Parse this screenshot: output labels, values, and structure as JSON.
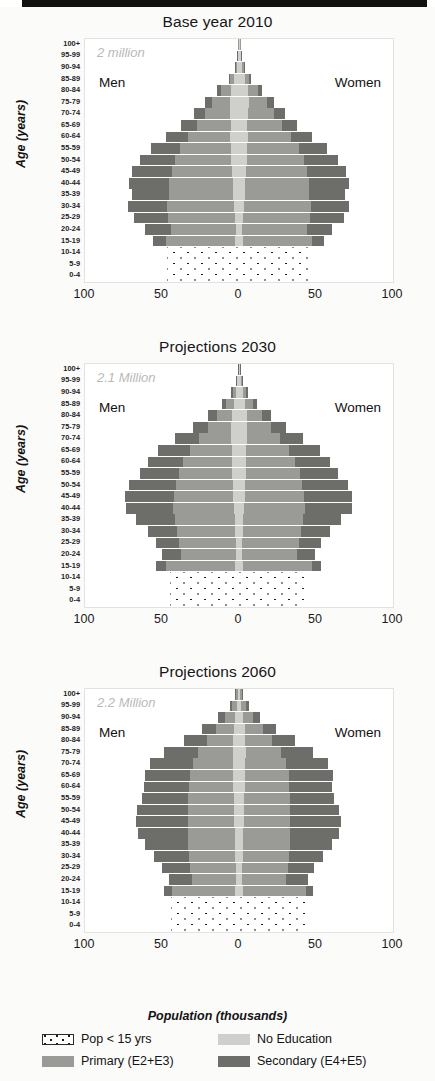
{
  "figure": {
    "xaxis_title": "Population (thousands)",
    "yaxis_title": "Age (years)",
    "men_label": "Men",
    "women_label": "Women",
    "xticks": [
      "100",
      "50",
      "0",
      "50",
      "100"
    ],
    "age_groups": [
      "100+",
      "95-99",
      "90-94",
      "85-89",
      "80-84",
      "75-79",
      "70-74",
      "65-69",
      "60-64",
      "55-59",
      "50-54",
      "45-49",
      "40-44",
      "35-39",
      "30-34",
      "25-29",
      "20-24",
      "15-19",
      "10-14",
      "5-9",
      "0-4"
    ],
    "colors": {
      "no_education": "#cfcfcb",
      "primary": "#9a9a96",
      "secondary": "#6d6d6a",
      "pop_under_15": "#ffffff",
      "dots": "#1b1b1b"
    }
  },
  "legend": {
    "items": [
      {
        "key": "pop_under_15",
        "label": "Pop < 15 yrs",
        "swatch": "kids"
      },
      {
        "key": "no_education",
        "label": "No Education",
        "swatch": "noedu"
      },
      {
        "key": "primary",
        "label": "Primary (E2+E3)",
        "swatch": "primary"
      },
      {
        "key": "secondary",
        "label": "Secondary (E4+E5)",
        "swatch": "secondary"
      }
    ]
  },
  "chart_data": [
    {
      "type": "bar",
      "title": "Base year 2010",
      "annotation": "2 million",
      "xlabel": "Population (thousands)",
      "ylabel": "Age (years)",
      "xlim": [
        -100,
        100
      ],
      "xticks": [
        -100,
        -50,
        0,
        50,
        100
      ],
      "grid": false,
      "legend_position": "below-figure",
      "categories": [
        "100+",
        "95-99",
        "90-94",
        "85-89",
        "80-84",
        "75-79",
        "70-74",
        "65-69",
        "60-64",
        "55-59",
        "50-54",
        "45-49",
        "40-44",
        "35-39",
        "30-34",
        "25-29",
        "20-24",
        "15-19",
        "10-14",
        "5-9",
        "0-4"
      ],
      "under15_groups": [
        "10-14",
        "5-9",
        "0-4"
      ],
      "under15_extent": {
        "men": 47,
        "women": 46
      },
      "series": [
        {
          "name": "No Education",
          "side": "men",
          "values": [
            0.6,
            0.9,
            1.6,
            3.0,
            5.0,
            5.8,
            5.6,
            5.4,
            5.6,
            5.4,
            5.0,
            4.6,
            4.2,
            3.6,
            3.0,
            2.4,
            1.9,
            2.6,
            null,
            null,
            null
          ]
        },
        {
          "name": "Primary",
          "side": "men",
          "values": [
            0.2,
            0.4,
            1.0,
            2.6,
            6.5,
            11.5,
            16.5,
            22.0,
            27.5,
            33.0,
            36.5,
            39.0,
            41.0,
            42.0,
            43.5,
            44.0,
            42.0,
            45.0,
            null,
            null,
            null
          ]
        },
        {
          "name": "Secondary",
          "side": "men",
          "values": [
            0.0,
            0.1,
            0.3,
            0.9,
            2.5,
            4.5,
            7.0,
            10.0,
            14.0,
            18.5,
            22.5,
            26.0,
            26.5,
            24.0,
            25.5,
            22.0,
            17.0,
            8.0,
            null,
            null,
            null
          ]
        },
        {
          "name": "No Education",
          "side": "women",
          "values": [
            0.7,
            1.1,
            2.0,
            3.6,
            5.6,
            6.2,
            5.8,
            5.5,
            5.6,
            5.4,
            5.0,
            4.6,
            4.2,
            3.6,
            3.0,
            2.4,
            1.9,
            2.6,
            null,
            null,
            null
          ]
        },
        {
          "name": "Primary",
          "side": "women",
          "values": [
            0.2,
            0.5,
            1.2,
            3.0,
            7.0,
            12.0,
            17.0,
            22.5,
            28.0,
            33.5,
            37.0,
            39.5,
            41.0,
            42.0,
            43.5,
            44.0,
            42.0,
            45.0,
            null,
            null,
            null
          ]
        },
        {
          "name": "Secondary",
          "side": "women",
          "values": [
            0.0,
            0.1,
            0.3,
            0.9,
            2.4,
            4.3,
            6.8,
            9.5,
            13.5,
            18.0,
            22.0,
            25.5,
            26.0,
            23.5,
            25.0,
            21.5,
            16.5,
            7.5,
            null,
            null,
            null
          ]
        }
      ]
    },
    {
      "type": "bar",
      "title": "Projections 2030",
      "annotation": "2.1 Million",
      "xlabel": "Population (thousands)",
      "ylabel": "Age (years)",
      "xlim": [
        -100,
        100
      ],
      "xticks": [
        -100,
        -50,
        0,
        50,
        100
      ],
      "grid": false,
      "legend_position": "below-figure",
      "categories": [
        "100+",
        "95-99",
        "90-94",
        "85-89",
        "80-84",
        "75-79",
        "70-74",
        "65-69",
        "60-64",
        "55-59",
        "50-54",
        "45-49",
        "40-44",
        "35-39",
        "30-34",
        "25-29",
        "20-24",
        "15-19",
        "10-14",
        "5-9",
        "0-4"
      ],
      "under15_groups": [
        "10-14",
        "5-9",
        "0-4"
      ],
      "under15_extent": {
        "men": 45,
        "women": 44
      },
      "series": [
        {
          "name": "No Education",
          "side": "men",
          "values": [
            0.5,
            1.0,
            2.0,
            3.4,
            4.6,
            5.0,
            5.0,
            4.8,
            4.6,
            4.4,
            4.0,
            3.6,
            3.2,
            2.8,
            2.4,
            2.0,
            1.7,
            2.4,
            null,
            null,
            null
          ]
        },
        {
          "name": "Primary",
          "side": "men",
          "values": [
            0.3,
            0.8,
            2.2,
            5.0,
            9.5,
            15.0,
            21.0,
            27.0,
            31.5,
            34.5,
            37.0,
            38.5,
            39.5,
            39.0,
            38.0,
            37.0,
            36.0,
            45.0,
            null,
            null,
            null
          ]
        },
        {
          "name": "Secondary",
          "side": "men",
          "values": [
            0.1,
            0.3,
            1.0,
            2.6,
            6.0,
            10.0,
            15.5,
            20.5,
            23.0,
            25.5,
            30.5,
            32.0,
            31.0,
            25.0,
            19.0,
            15.0,
            12.0,
            6.5,
            null,
            null,
            null
          ]
        },
        {
          "name": "No Education",
          "side": "women",
          "values": [
            0.6,
            1.2,
            2.3,
            3.8,
            5.0,
            5.2,
            5.0,
            4.8,
            4.6,
            4.4,
            4.0,
            3.6,
            3.2,
            2.8,
            2.4,
            2.0,
            1.7,
            2.4,
            null,
            null,
            null
          ]
        },
        {
          "name": "Primary",
          "side": "women",
          "values": [
            0.3,
            0.9,
            2.4,
            5.4,
            10.0,
            15.5,
            21.5,
            27.5,
            32.0,
            35.0,
            37.0,
            38.5,
            39.5,
            39.0,
            38.0,
            37.0,
            36.0,
            45.0,
            null,
            null,
            null
          ]
        },
        {
          "name": "Secondary",
          "side": "women",
          "values": [
            0.1,
            0.3,
            1.0,
            2.5,
            5.8,
            9.6,
            15.0,
            20.0,
            22.5,
            25.0,
            30.0,
            31.5,
            30.5,
            24.5,
            18.5,
            14.5,
            11.5,
            6.0,
            null,
            null,
            null
          ]
        }
      ]
    },
    {
      "type": "bar",
      "title": "Projections 2060",
      "annotation": "2.2 Million",
      "xlabel": "Population (thousands)",
      "ylabel": "Age (years)",
      "xlim": [
        -100,
        100
      ],
      "xticks": [
        -100,
        -50,
        0,
        50,
        100
      ],
      "grid": false,
      "legend_position": "below-figure",
      "categories": [
        "100+",
        "95-99",
        "90-94",
        "85-89",
        "80-84",
        "75-79",
        "70-74",
        "65-69",
        "60-64",
        "55-59",
        "50-54",
        "45-49",
        "40-44",
        "35-39",
        "30-34",
        "25-29",
        "20-24",
        "15-19",
        "10-14",
        "5-9",
        "0-4"
      ],
      "under15_groups": [
        "10-14",
        "5-9",
        "0-4"
      ],
      "under15_extent": {
        "men": 44,
        "women": 43
      },
      "series": [
        {
          "name": "No Education",
          "side": "men",
          "values": [
            0.8,
            1.4,
            2.4,
            3.4,
            4.0,
            4.2,
            4.0,
            3.8,
            3.6,
            3.4,
            3.2,
            3.0,
            2.8,
            2.6,
            2.3,
            2.0,
            1.8,
            2.4,
            null,
            null,
            null
          ]
        },
        {
          "name": "Primary",
          "side": "men",
          "values": [
            1.2,
            3.0,
            6.5,
            11.5,
            17.0,
            22.5,
            26.0,
            28.0,
            29.0,
            29.5,
            30.0,
            30.0,
            30.5,
            30.5,
            30.0,
            29.5,
            29.0,
            41.0,
            null,
            null,
            null
          ]
        },
        {
          "name": "Secondary",
          "side": "men",
          "values": [
            0.5,
            1.6,
            4.5,
            9.0,
            15.0,
            22.0,
            28.0,
            29.5,
            29.0,
            30.0,
            33.0,
            34.0,
            32.5,
            28.0,
            23.0,
            18.5,
            14.5,
            5.0,
            null,
            null,
            null
          ]
        },
        {
          "name": "No Education",
          "side": "women",
          "values": [
            0.9,
            1.6,
            2.6,
            3.6,
            4.2,
            4.3,
            4.0,
            3.8,
            3.6,
            3.4,
            3.2,
            3.0,
            2.8,
            2.6,
            2.3,
            2.0,
            1.8,
            2.4,
            null,
            null,
            null
          ]
        },
        {
          "name": "Primary",
          "side": "women",
          "values": [
            1.3,
            3.2,
            6.8,
            12.0,
            17.5,
            23.0,
            26.5,
            28.5,
            29.0,
            29.5,
            30.0,
            30.0,
            30.5,
            30.5,
            30.0,
            29.5,
            29.0,
            41.0,
            null,
            null,
            null
          ]
        },
        {
          "name": "Secondary",
          "side": "women",
          "values": [
            0.5,
            1.5,
            4.3,
            8.6,
            14.5,
            21.0,
            27.0,
            28.5,
            28.0,
            29.0,
            32.0,
            33.0,
            31.5,
            27.0,
            22.0,
            17.5,
            14.0,
            4.5,
            null,
            null,
            null
          ]
        }
      ]
    }
  ]
}
